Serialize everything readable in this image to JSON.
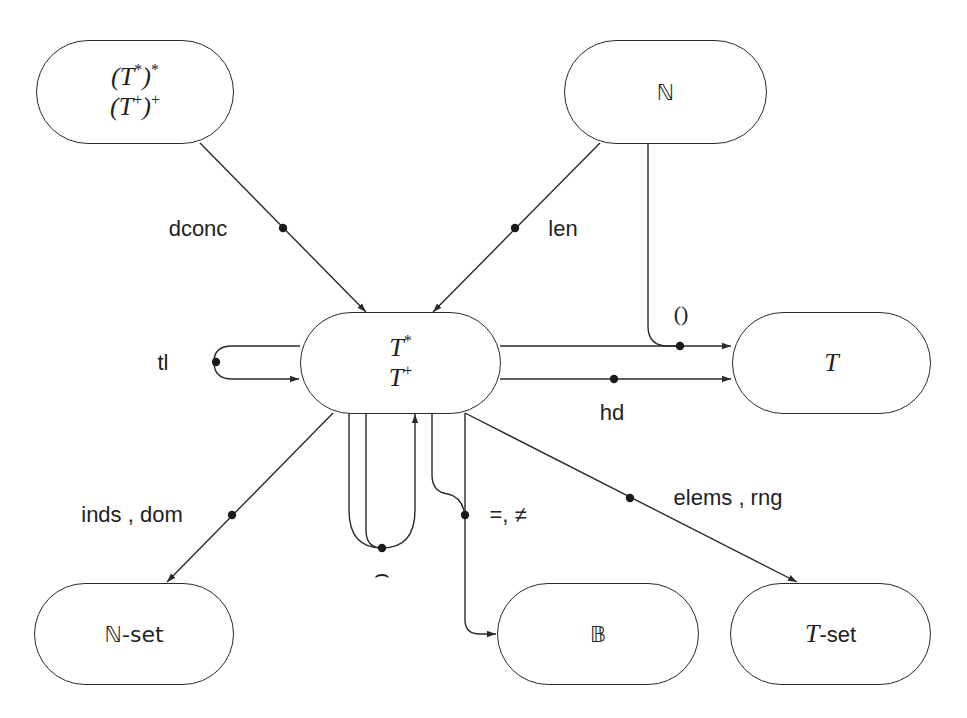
{
  "diagram": {
    "type": "signature diagram of sequence operators",
    "nodes": {
      "seqseq": {
        "line1": "(T*)*",
        "line2": "(T+)+"
      },
      "nat": {
        "label": "ℕ"
      },
      "seq": {
        "line1": "T*",
        "line2": "T+"
      },
      "t": {
        "label": "T"
      },
      "natset": {
        "label": "ℕ-set"
      },
      "bool": {
        "label": "𝔹"
      },
      "tset": {
        "label_italic": "T",
        "label_suffix": "-set"
      }
    },
    "edges": [
      {
        "id": "dconc",
        "label": "dconc",
        "from": "(T*)* / (T+)+",
        "to": "T* / T+"
      },
      {
        "id": "len",
        "label": "len",
        "from": "ℕ",
        "to": "T* / T+"
      },
      {
        "id": "apply",
        "label": "()",
        "from": [
          "T* / T+",
          "ℕ"
        ],
        "to": "T"
      },
      {
        "id": "hd",
        "label": "hd",
        "from": "T* / T+",
        "to": "T"
      },
      {
        "id": "tl",
        "label": "tl",
        "from": "T* / T+",
        "to": "T* / T+"
      },
      {
        "id": "conc",
        "label": "⌢",
        "from": "T* / T+ (two args)",
        "to": "T* / T+"
      },
      {
        "id": "eq",
        "label": "=, ≠",
        "from": "T* / T+ (two args)",
        "to": "𝔹"
      },
      {
        "id": "inds",
        "label": "inds , dom",
        "from": "T* / T+",
        "to": "ℕ-set"
      },
      {
        "id": "elems",
        "label": "elems , rng",
        "from": "T* / T+",
        "to": "T-set"
      }
    ],
    "colors": {
      "stroke": "#2a2a2a",
      "text": "#222222",
      "background": "#ffffff"
    }
  }
}
